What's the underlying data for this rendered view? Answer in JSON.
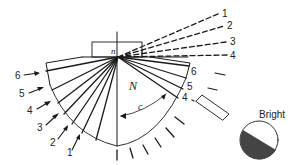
{
  "diagram": {
    "prism_label": "n",
    "medium_label": "N",
    "angle_label": "c",
    "bright_label": "Bright",
    "incident_labels_left": [
      "6",
      "5",
      "4",
      "3",
      "2",
      "1"
    ],
    "refracted_labels_dashed": [
      "1",
      "2",
      "3",
      "4"
    ],
    "reflected_labels_right": [
      "6",
      "5",
      "4"
    ],
    "colors": {
      "line": "#1a1a1a",
      "dark_half": "#444444",
      "background": "#ffffff"
    }
  }
}
